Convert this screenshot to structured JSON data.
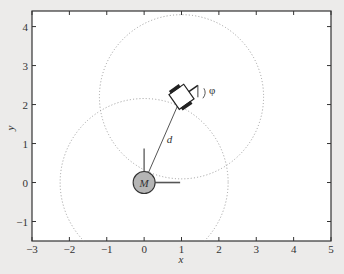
{
  "figure": {
    "xlabel": "x",
    "ylabel": "y",
    "xlim": [
      -3,
      5
    ],
    "ylim": [
      -1.5,
      4.4
    ],
    "xticks": [
      "−3",
      "−2",
      "−1",
      "0",
      "1",
      "2",
      "3",
      "4",
      "5"
    ],
    "yticks": [
      "−1",
      "0",
      "1",
      "2",
      "3",
      "4"
    ],
    "xtick_values": [
      -3,
      -2,
      -1,
      0,
      1,
      2,
      3,
      4,
      5
    ],
    "ytick_values": [
      -1,
      0,
      1,
      2,
      3,
      4
    ]
  },
  "robot": {
    "label": "M",
    "x": 0,
    "y": 0,
    "fill": "#b5b5b5"
  },
  "vehicle": {
    "x": 1,
    "y": 2.2,
    "heading_deg": 35
  },
  "annotations": {
    "distance_label": "d",
    "angle_label": "φ"
  },
  "circles": [
    {
      "name": "robot-range-circle",
      "cx": 0,
      "cy": 0,
      "r": 2.2
    },
    {
      "name": "vehicle-range-circle",
      "cx": 1,
      "cy": 2.2,
      "r": 2.15
    }
  ],
  "colors": {
    "background": "#ecebea",
    "plot_area": "#ffffff",
    "axes": "#333333",
    "dotted": "#9a9a9a",
    "robot_fill": "#b5b5b5"
  }
}
